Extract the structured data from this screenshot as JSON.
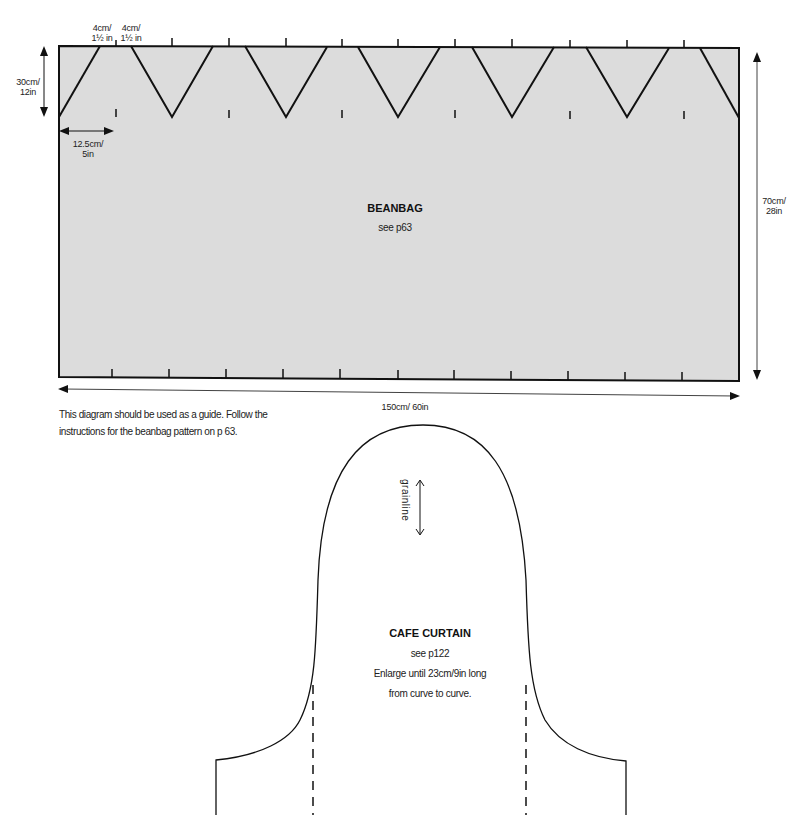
{
  "beanbag": {
    "title": "BEANBAG",
    "subtitle": "see p63",
    "fill_color": "#dcdcdc",
    "dimensions": {
      "point_width_1": {
        "cm": "4cm/",
        "in": "1½ in"
      },
      "point_width_2": {
        "cm": "4cm/",
        "in": "1½ in"
      },
      "height_top": {
        "cm": "30cm/",
        "in": "12in"
      },
      "spacing": {
        "cm": "12.5cm/",
        "in": "5in"
      },
      "total_height": {
        "cm": "70cm/",
        "in": "28in"
      },
      "total_width": "150cm/ 60in"
    },
    "note_line1": "This diagram should be used as a guide. Follow the",
    "note_line2": "instructions for the beanbag pattern on p 63."
  },
  "cafe_curtain": {
    "title": "CAFE CURTAIN",
    "subtitle": "see p122",
    "instruction_line1": "Enlarge until 23cm/9in long",
    "instruction_line2": "from curve to curve.",
    "grainline_label": "grainline"
  }
}
